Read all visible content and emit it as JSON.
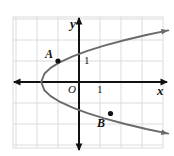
{
  "figure": {
    "kind": "coordinate-plane-graph",
    "background_color": "#ffffff",
    "grid_color": "#dcdcdc",
    "axis_color": "#111111",
    "curve_color": "#6b6b6b",
    "point_color": "#111111",
    "label_color": "#111111"
  },
  "axes": {
    "x_label": "x",
    "y_label": "y",
    "origin_label": "O",
    "x_tick_label": "1",
    "y_tick_label": "1",
    "x_arrows": "both",
    "y_arrows": "both"
  },
  "points": [
    {
      "name": "A",
      "label": "A",
      "x": -1,
      "y": 1,
      "label_position": "upper-left"
    },
    {
      "name": "B",
      "label": "B",
      "x": 1.5,
      "y": -1.5,
      "label_position": "lower-left"
    }
  ],
  "chart_data": {
    "type": "line",
    "title": "",
    "xlabel": "x",
    "ylabel": "y",
    "grid": true,
    "legend": "none",
    "xlim": [
      -3.2,
      4.2
    ],
    "ylim": [
      -3.1,
      3.1
    ],
    "x_ticks": [
      1
    ],
    "y_ticks": [
      1
    ],
    "curve_name": "rightward-opening parabola",
    "curve_equation": "x = y^2 - 1.8",
    "vertex": [
      -1.8,
      0
    ],
    "series": [
      {
        "name": "parabola",
        "points_x": [
          4.25,
          3.2,
          2.2,
          1.2,
          0.4,
          -0.3,
          -0.9,
          -1.35,
          -1.65,
          -1.8,
          -1.65,
          -1.35,
          -0.9,
          -0.3,
          0.4,
          1.2,
          2.2,
          3.2,
          4.25
        ],
        "points_y": [
          2.46,
          2.24,
          2.0,
          1.73,
          1.48,
          1.22,
          0.95,
          0.67,
          0.39,
          0.0,
          -0.39,
          -0.67,
          -0.95,
          -1.22,
          -1.48,
          -1.73,
          -2.0,
          -2.24,
          -2.46
        ]
      }
    ],
    "labeled_points": [
      {
        "label": "A",
        "x": -1,
        "y": 1
      },
      {
        "label": "B",
        "x": 1.5,
        "y": -1.5
      }
    ]
  }
}
